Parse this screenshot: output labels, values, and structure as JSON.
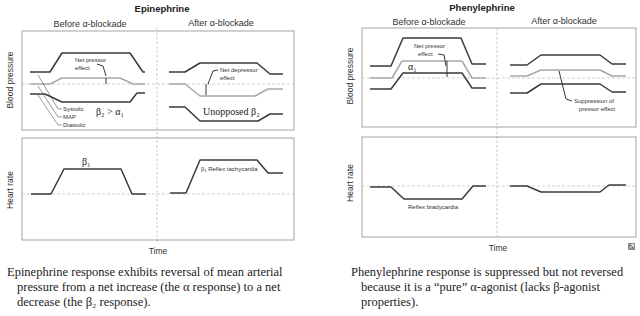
{
  "panels": [
    {
      "drug": "Epinephrine",
      "before_label": "Before α-blockade",
      "after_label": "After α-blockade",
      "bp_axis_label": "Blood pressure",
      "hr_axis_label": "Heart rate",
      "time_label": "Time",
      "annotations": {
        "net_pressor_1": "Net pressor",
        "net_pressor_2": "effect",
        "beta2_gt": "β₂ > α₁",
        "legend_systolic": "Systolic",
        "legend_map": "MAP",
        "legend_diastolic": "Diastolic",
        "net_depressor_1": "Net depressor",
        "net_depressor_2": "effect",
        "unopposed": "Unopposed β₂",
        "beta1": "β₁",
        "reflex_tachy": "β₁ Reflex tachycardia"
      },
      "caption_line1": "Epinephrine response exhibits reversal of mean arterial",
      "caption_line2": "pressure from a net increase (the α response) to a net",
      "caption_line3": "decrease (the β₂ response)."
    },
    {
      "drug": "Phenylephrine",
      "before_label": "Before α-blockade",
      "after_label": "After α-blockade",
      "bp_axis_label": "Blood pressure",
      "hr_axis_label": "Heart rate",
      "time_label": "Time",
      "annotations": {
        "net_pressor_1": "Net pressor",
        "net_pressor_2": "effect",
        "alpha1": "α₁",
        "suppression_1": "Suppression of",
        "suppression_2": "pressor effect",
        "reflex_brady": "Reflex bradycardia"
      },
      "caption_line1": "Phenylephrine response is suppressed but not reversed",
      "caption_line2": "because it is a “pure” α-agonist (lacks β-agonist",
      "caption_line3": "properties)."
    }
  ],
  "colors": {
    "systolic_diastolic_line": "#3a3a3a",
    "map_line": "#a8a8a8",
    "frame": "#9a9a9a"
  }
}
